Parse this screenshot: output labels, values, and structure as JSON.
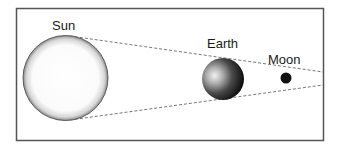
{
  "diagram": {
    "bodies": [
      {
        "id": "sun",
        "label": "Sun"
      },
      {
        "id": "earth",
        "label": "Earth"
      },
      {
        "id": "moon",
        "label": "Moon"
      }
    ],
    "colors": {
      "frame": "#555555",
      "dash_line": "#777777",
      "sun_edge": "#555555",
      "earth_dark": "#111111",
      "moon_fill": "#111111"
    }
  }
}
